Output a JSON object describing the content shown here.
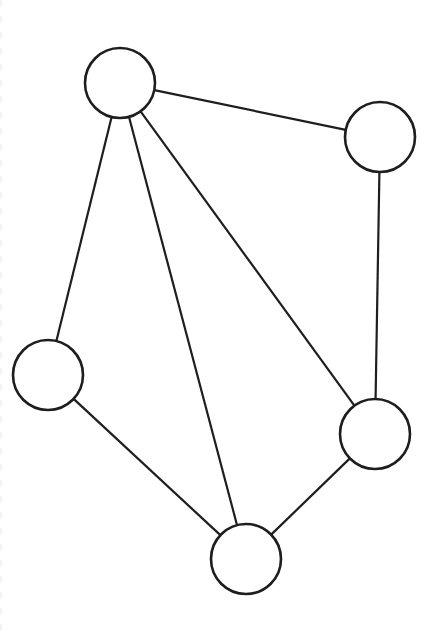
{
  "diagram": {
    "type": "undirected-graph",
    "colors": {
      "stroke": "#1e1e1e",
      "background": "#ffffff"
    },
    "node_radius": 35,
    "nodes": [
      {
        "id": "A",
        "position": "top",
        "cx": 120,
        "cy": 83
      },
      {
        "id": "B",
        "position": "right-top",
        "cx": 380,
        "cy": 137
      },
      {
        "id": "C",
        "position": "left",
        "cx": 48,
        "cy": 375
      },
      {
        "id": "D",
        "position": "right-bottom",
        "cx": 375,
        "cy": 434
      },
      {
        "id": "E",
        "position": "bottom",
        "cx": 246,
        "cy": 559
      }
    ],
    "edges": [
      {
        "from": "A",
        "to": "B"
      },
      {
        "from": "A",
        "to": "C"
      },
      {
        "from": "A",
        "to": "E"
      },
      {
        "from": "A",
        "to": "D"
      },
      {
        "from": "B",
        "to": "D"
      },
      {
        "from": "C",
        "to": "E"
      },
      {
        "from": "E",
        "to": "D"
      }
    ]
  }
}
